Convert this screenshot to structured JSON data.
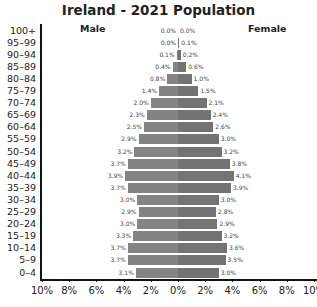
{
  "chart_data": {
    "type": "bar",
    "orientation": "horizontal",
    "subtype": "population-pyramid",
    "title": "Ireland - 2021 Population",
    "xlabel": "",
    "ylabel": "",
    "xlim": [
      -10,
      10
    ],
    "x_tick_labels": [
      "10%",
      "8%",
      "6%",
      "4%",
      "2%",
      "0%",
      "2%",
      "4%",
      "6%",
      "8%",
      "10%"
    ],
    "grid": false,
    "legend": [
      "Male",
      "Female"
    ],
    "categories": [
      "100+",
      "95-99",
      "90-94",
      "85-89",
      "80-84",
      "75-79",
      "70-74",
      "65-69",
      "60-64",
      "55-59",
      "50-54",
      "45-49",
      "40-44",
      "35-39",
      "30-34",
      "25-29",
      "20-24",
      "15-19",
      "10-14",
      "5-9",
      "0-4"
    ],
    "series": [
      {
        "name": "Male",
        "values": [
          0.0,
          0.0,
          0.1,
          0.4,
          0.8,
          1.4,
          2.0,
          2.3,
          2.5,
          2.9,
          3.2,
          3.7,
          3.9,
          3.7,
          3.0,
          2.9,
          3.0,
          3.3,
          3.7,
          3.7,
          3.1
        ],
        "labels": [
          "0.0%",
          "0.0%",
          "0.1%",
          "0.4%",
          "0.8%",
          "1.4%",
          "2.0%",
          "2.3%",
          "2.5%",
          "2.9%",
          "3.2%",
          "3.7%",
          "3.9%",
          "3.7%",
          "3.0%",
          "2.9%",
          "3.0%",
          "3.3%",
          "3.7%",
          "3.7%",
          "3.1%"
        ]
      },
      {
        "name": "Female",
        "values": [
          0.0,
          0.1,
          0.2,
          0.6,
          1.0,
          1.5,
          2.1,
          2.4,
          2.6,
          3.0,
          3.2,
          3.8,
          4.1,
          3.9,
          3.0,
          2.8,
          2.9,
          3.2,
          3.6,
          3.5,
          3.0
        ],
        "labels": [
          "0.0%",
          "0.1%",
          "0.2%",
          "0.6%",
          "1.0%",
          "1.5%",
          "2.1%",
          "2.4%",
          "2.6%",
          "3.0%",
          "3.2%",
          "3.8%",
          "4.1%",
          "3.9%",
          "3.0%",
          "2.8%",
          "2.9%",
          "3.2%",
          "3.6%",
          "3.5%",
          "3.0%"
        ]
      }
    ]
  },
  "labels": {
    "male": "Male",
    "female": "Female"
  },
  "colors": {
    "male": "#848484",
    "female": "#737373",
    "axis": "#111111"
  }
}
